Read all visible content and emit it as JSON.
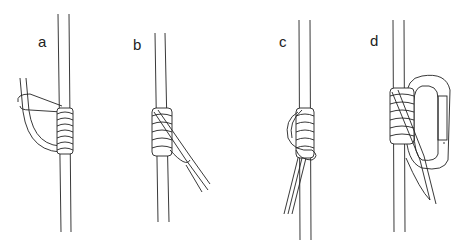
{
  "figure": {
    "panels": [
      {
        "label": "a",
        "caption": "cord loop laid against rope, wraps started"
      },
      {
        "label": "b",
        "caption": "wraps completed, tails crossing down"
      },
      {
        "label": "c",
        "caption": "tails passed through loop to lock"
      },
      {
        "label": "d",
        "caption": "hitch clipped to carabiner"
      }
    ]
  }
}
